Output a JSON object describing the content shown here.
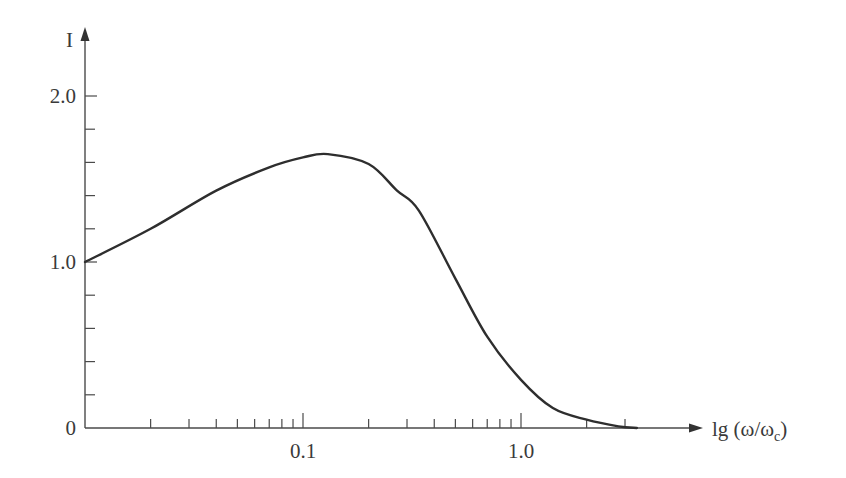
{
  "chart_data": {
    "type": "line",
    "title": "",
    "xlabel": "lg (ω/ωc)",
    "xlabel_main": "lg (ω/ω",
    "xlabel_sub": "c",
    "xlabel_close": ")",
    "ylabel": "I",
    "xscale": "log",
    "xlim": [
      0.01,
      5
    ],
    "ylim": [
      0,
      2.2
    ],
    "grid": false,
    "legend": null,
    "x_tick_labels": [
      {
        "value": 0.1,
        "label": "0.1"
      },
      {
        "value": 1.0,
        "label": "1.0"
      }
    ],
    "y_tick_labels": [
      {
        "value": 0,
        "label": "0"
      },
      {
        "value": 1.0,
        "label": "1.0"
      },
      {
        "value": 2.0,
        "label": "2.0"
      }
    ],
    "y_minor_ticks": [
      0.2,
      0.4,
      0.6,
      0.8,
      1.2,
      1.4,
      1.6,
      1.8
    ],
    "x_minor_ticks": [
      0.02,
      0.03,
      0.04,
      0.05,
      0.06,
      0.07,
      0.08,
      0.09,
      0.2,
      0.3,
      0.4,
      0.5,
      0.6,
      0.7,
      0.8,
      0.9,
      2,
      3
    ],
    "series": [
      {
        "name": "I",
        "x": [
          0.01,
          0.02,
          0.04,
          0.07,
          0.1,
          0.13,
          0.2,
          0.27,
          0.34,
          0.5,
          0.7,
          1.0,
          1.4,
          2.0,
          2.8,
          3.4
        ],
        "y": [
          1.0,
          1.2,
          1.43,
          1.57,
          1.63,
          1.65,
          1.59,
          1.43,
          1.31,
          0.9,
          0.55,
          0.29,
          0.12,
          0.05,
          0.01,
          0.0
        ]
      }
    ]
  }
}
